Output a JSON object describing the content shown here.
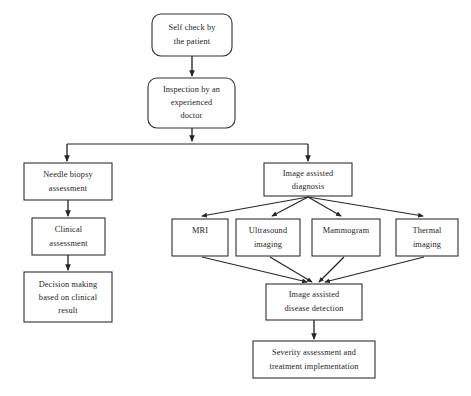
{
  "diagram": {
    "background_color": "#ffffff",
    "line_color": "#262626",
    "text_color": "#1d1d1d",
    "nodes": [
      {
        "id": "self-check",
        "label_lines": [
          "Self check by",
          "the patient"
        ],
        "shape": "rounded-rectangle",
        "x": 152,
        "y": 14,
        "w": 80,
        "h": 42
      },
      {
        "id": "inspection",
        "label_lines": [
          "Inspection by an",
          "experienced",
          "doctor"
        ],
        "shape": "rounded-rectangle",
        "x": 148,
        "y": 78,
        "w": 87,
        "h": 50
      },
      {
        "id": "needle-biopsy",
        "label_lines": [
          "Needle biopsy",
          "assessment"
        ],
        "shape": "rectangle",
        "x": 24,
        "y": 163,
        "w": 88,
        "h": 37
      },
      {
        "id": "image-assisted-diagnosis",
        "label_lines": [
          "Image assisted",
          "diagnosis"
        ],
        "shape": "rectangle",
        "x": 264,
        "y": 163,
        "w": 88,
        "h": 33
      },
      {
        "id": "clinical-assessment",
        "label_lines": [
          "Clinical",
          "assessment"
        ],
        "shape": "rectangle",
        "x": 32,
        "y": 218,
        "w": 73,
        "h": 37
      },
      {
        "id": "mri",
        "label_lines": [
          "MRI"
        ],
        "shape": "rectangle",
        "x": 172,
        "y": 219,
        "w": 56,
        "h": 37
      },
      {
        "id": "ultrasound-imaging",
        "label_lines": [
          "Ultrasound",
          "imaging"
        ],
        "shape": "rectangle",
        "x": 236,
        "y": 219,
        "w": 64,
        "h": 37
      },
      {
        "id": "mammogram",
        "label_lines": [
          "Mammogram"
        ],
        "shape": "rectangle",
        "x": 312,
        "y": 219,
        "w": 68,
        "h": 37
      },
      {
        "id": "thermal-imaging",
        "label_lines": [
          "Thermal",
          "imaging"
        ],
        "shape": "rectangle",
        "x": 396,
        "y": 219,
        "w": 62,
        "h": 37
      },
      {
        "id": "decision-making",
        "label_lines": [
          "Decision making",
          "based on clinical",
          "result"
        ],
        "shape": "rectangle",
        "x": 24,
        "y": 272,
        "w": 88,
        "h": 50
      },
      {
        "id": "image-assisted-detection",
        "label_lines": [
          "Image assisted",
          "disease detection"
        ],
        "shape": "rectangle",
        "x": 266,
        "y": 284,
        "w": 96,
        "h": 36
      },
      {
        "id": "severity-assessment",
        "label_lines": [
          "Severity assessment and",
          "treatment implementation"
        ],
        "shape": "rectangle",
        "x": 253,
        "y": 341,
        "w": 122,
        "h": 37
      }
    ],
    "edges": [
      {
        "id": "self-check-to-inspection",
        "from": "self-check",
        "to": "inspection",
        "style": "straight-vertical"
      },
      {
        "id": "inspection-to-split",
        "from": "inspection",
        "to": "branch-bus",
        "style": "straight-vertical"
      },
      {
        "id": "bus-to-needle-biopsy",
        "from": "branch-bus",
        "to": "needle-biopsy",
        "style": "orthogonal"
      },
      {
        "id": "bus-to-image-diagnosis",
        "from": "branch-bus",
        "to": "image-assisted-diagnosis",
        "style": "orthogonal"
      },
      {
        "id": "needle-to-clinical",
        "from": "needle-biopsy",
        "to": "clinical-assessment",
        "style": "straight-vertical"
      },
      {
        "id": "clinical-to-decision",
        "from": "clinical-assessment",
        "to": "decision-making",
        "style": "straight-vertical"
      },
      {
        "id": "diagnosis-to-mri",
        "from": "image-assisted-diagnosis",
        "to": "mri",
        "style": "diagonal"
      },
      {
        "id": "diagnosis-to-ultrasound",
        "from": "image-assisted-diagnosis",
        "to": "ultrasound-imaging",
        "style": "diagonal"
      },
      {
        "id": "diagnosis-to-mammogram",
        "from": "image-assisted-diagnosis",
        "to": "mammogram",
        "style": "diagonal"
      },
      {
        "id": "diagnosis-to-thermal",
        "from": "image-assisted-diagnosis",
        "to": "thermal-imaging",
        "style": "diagonal"
      },
      {
        "id": "mri-to-detection",
        "from": "mri",
        "to": "image-assisted-detection",
        "style": "diagonal"
      },
      {
        "id": "ultrasound-to-detection",
        "from": "ultrasound-imaging",
        "to": "image-assisted-detection",
        "style": "diagonal"
      },
      {
        "id": "mammogram-to-detection",
        "from": "mammogram",
        "to": "image-assisted-detection",
        "style": "diagonal"
      },
      {
        "id": "thermal-to-detection",
        "from": "thermal-imaging",
        "to": "image-assisted-detection",
        "style": "diagonal"
      },
      {
        "id": "detection-to-severity",
        "from": "image-assisted-detection",
        "to": "severity-assessment",
        "style": "straight-vertical"
      }
    ]
  }
}
